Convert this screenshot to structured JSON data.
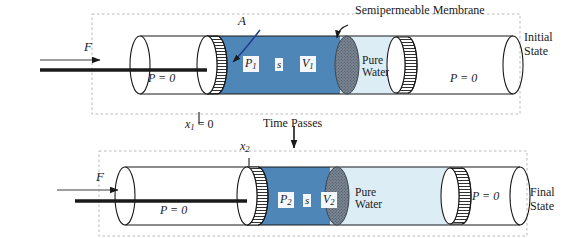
{
  "figure": {
    "kind": "osmotic-pressure-piston-diagram",
    "background_color": "#ffffff",
    "ink_color": "#1a1a1a",
    "solution_color": "#4e86b8",
    "pure_water_color": "#ddedf6",
    "membrane_color": "#5f6a77",
    "piston_face_color": "#ffffff",
    "dashed_border_color": "#b9b9b9"
  },
  "panels": {
    "initial": {
      "state_label_line1": "Initial",
      "state_label_line2": "State",
      "force_label": "F",
      "left_chamber_pressure": "P = 0",
      "right_chamber_pressure": "P = 0",
      "solution_pressure": "P",
      "solution_pressure_sub": "1",
      "solution_entropy": "s",
      "solution_volume": "V",
      "solution_volume_sub": "1",
      "pure_water_line1": "Pure",
      "pure_water_line2": "Water",
      "area_label": "A",
      "membrane_label": "Semipermeable Membrane",
      "position_label": "x",
      "position_label_sub": "1",
      "position_label_value": "= 0"
    },
    "final": {
      "state_label_line1": "Final",
      "state_label_line2": "State",
      "force_label": "F",
      "left_chamber_pressure": "P = 0",
      "right_chamber_pressure": "P = 0",
      "solution_pressure": "P",
      "solution_pressure_sub": "2",
      "solution_entropy": "s",
      "solution_volume": "V",
      "solution_volume_sub": "2",
      "pure_water_line1": "Pure",
      "pure_water_line2": "Water",
      "position_label": "x",
      "position_label_sub": "2"
    }
  },
  "transition": {
    "label": "Time Passes",
    "arrow": "down-arrow-icon"
  }
}
